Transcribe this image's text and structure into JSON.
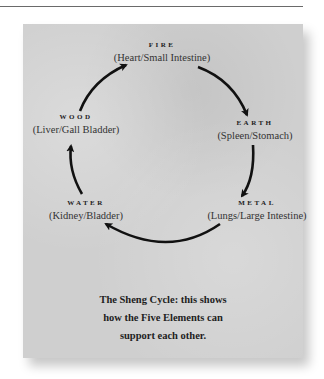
{
  "diagram": {
    "title": "The Sheng Cycle",
    "colors": {
      "card": "#cfcfcf",
      "arrow": "#111111",
      "text": "#2a2a2a"
    },
    "elements": [
      {
        "name": "FIRE",
        "organs": "(Heart/Small Intestine)"
      },
      {
        "name": "EARTH",
        "organs": "(Spleen/Stomach)"
      },
      {
        "name": "METAL",
        "organs": "(Lungs/Large Intestine)"
      },
      {
        "name": "WATER",
        "organs": "(Kidney/Bladder)"
      },
      {
        "name": "WOOD",
        "organs": "(Liver/Gall Bladder)"
      }
    ],
    "cycle": [
      "WOOD",
      "FIRE",
      "EARTH",
      "METAL",
      "WATER",
      "WOOD"
    ],
    "caption": {
      "line1": "The Sheng Cycle: this shows",
      "line2": "how the Five Elements can",
      "line3": "support each other."
    }
  }
}
